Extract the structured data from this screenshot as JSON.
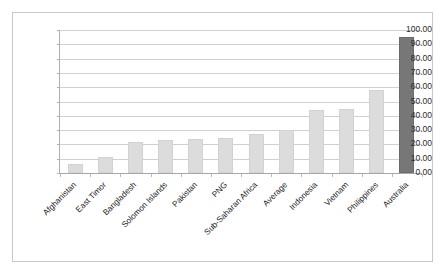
{
  "chart_data": {
    "type": "bar",
    "title": "",
    "subtitle": "",
    "xlabel": "",
    "ylabel": "",
    "ylim": [
      0,
      100
    ],
    "ytick_step": 10,
    "ytick_labels": [
      "0.00",
      "10.00",
      "20.00",
      "30.00",
      "40.00",
      "50.00",
      "60.00",
      "70.00",
      "80.00",
      "90.00",
      "100.00"
    ],
    "grid": true,
    "legend": "none",
    "categories": [
      "Afghanistan",
      "East Timor",
      "Bangladesh",
      "Solomon Islands",
      "Pakistan",
      "PNG",
      "Sub-Saharan Africa",
      "Average",
      "Indonesia",
      "Vietnam",
      "Philippines",
      "Australia"
    ],
    "values": [
      6.0,
      11.5,
      22.0,
      23.0,
      23.5,
      24.5,
      27.0,
      30.0,
      44.0,
      45.0,
      58.0,
      95.0
    ],
    "bar_colors": [
      "#dcdcdc",
      "#dcdcdc",
      "#dcdcdc",
      "#dcdcdc",
      "#dcdcdc",
      "#dcdcdc",
      "#dcdcdc",
      "#dcdcdc",
      "#dcdcdc",
      "#dcdcdc",
      "#dcdcdc",
      "#777777"
    ],
    "highlight_category": "Australia",
    "colors": {
      "bar_light": "#dcdcdc",
      "bar_dark": "#777777",
      "gridline": "#d0d0d0",
      "axis": "#b0b0b0",
      "frame_border": "#c8c8c8",
      "text": "#1a1a1a",
      "background": "#ffffff"
    }
  }
}
